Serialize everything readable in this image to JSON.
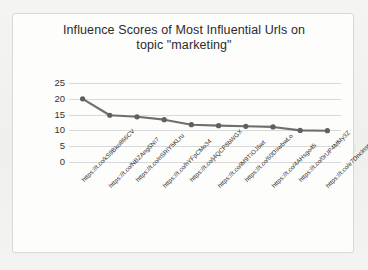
{
  "chart_data": {
    "type": "line",
    "title": "Influence Scores of Most Influential Urls on topic \"marketing\"",
    "title_lines": [
      "Influence Scores of Most Influential Urls on",
      "topic \"marketing\""
    ],
    "xlabel": "",
    "ylabel": "",
    "ylim": [
      0,
      25
    ],
    "yticks": [
      0,
      5,
      10,
      15,
      20,
      25
    ],
    "ytick_labels": [
      "0",
      "5",
      "10",
      "15",
      "20",
      "25"
    ],
    "grid": true,
    "legend": false,
    "legend_position": "none",
    "marker": "circle",
    "line_color": "#6f6f6f",
    "marker_color": "#5f5f5f",
    "grid_color": "#d9d9d9",
    "categories": [
      "https://t.co/kS9Bko866CV",
      "https://t.co/NBZAngSNI7",
      "https://t.co/nSRlY5KLru",
      "https://t.co/hYFpCMo34",
      "https://t.co/j4QCP8bWGX",
      "https://t.co/iM9TIOJ6wt",
      "https://t.co/60DIiwbwLo",
      "https://t.co/4AHsgo45",
      "https://t.co/0rUP4MMy3Z",
      "https://t.co/e7Dnclnsm1"
    ],
    "values": [
      20.0,
      14.8,
      14.3,
      13.4,
      11.8,
      11.5,
      11.3,
      11.1,
      10.0,
      9.9
    ]
  }
}
